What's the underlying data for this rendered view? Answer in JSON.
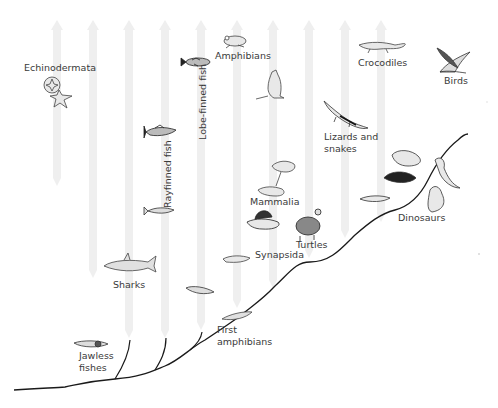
{
  "diagram": {
    "type": "evolutionary-tree",
    "arrow_color": "#efefef",
    "line_color": "#1a1a1a",
    "labels": {
      "echinodermata": "Echinodermata",
      "amphibians": "Amphibians",
      "lobe_finned_fish": "Lobe-finned fish",
      "rayfinned_fish": "Rayfinned fish",
      "crocodiles": "Crocodiles",
      "birds": "Birds",
      "lizards_and_snakes_1": "Lizards and",
      "lizards_and_snakes_2": "snakes",
      "mammalia": "Mammalia",
      "turtles": "Turtles",
      "synapsida": "Synapsida",
      "dinosaurs": "Dinosaurs",
      "sharks": "Sharks",
      "first_amphibians_1": "First",
      "first_amphibians_2": "amphibians",
      "jawless_fishes_1": "Jawless",
      "jawless_fishes_2": "fishes"
    },
    "arrows_count": 10
  }
}
